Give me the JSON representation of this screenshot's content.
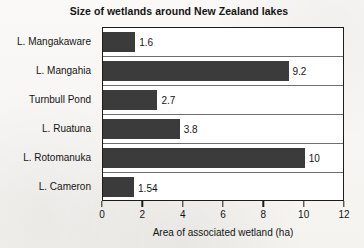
{
  "chart_data": {
    "type": "bar",
    "orientation": "horizontal",
    "title": "Size of wetlands around New Zealand lakes",
    "xlabel": "Area of associated wetland (ha)",
    "ylabel": "",
    "xlim": [
      0,
      12
    ],
    "xticks": [
      0,
      2,
      4,
      6,
      8,
      10,
      12
    ],
    "xtick_labels": [
      "0",
      "2",
      "4",
      "6",
      "8",
      "10",
      "12"
    ],
    "grid": "horizontal-category-separators",
    "legend": "none",
    "categories": [
      "L. Mangakaware",
      "L. Mangahia",
      "Turnbull Pond",
      "L. Ruatuna",
      "L. Rotomanuka",
      "L. Cameron"
    ],
    "values": [
      1.6,
      9.2,
      2.7,
      3.8,
      10,
      1.54
    ],
    "data_labels": [
      "1.6",
      "9.2",
      "2.7",
      "3.8",
      "10",
      "1.54"
    ],
    "bar_color": "#3b3b3b",
    "plot_background": "#ffffff",
    "frame_color": "#1c1c1c",
    "figure_background": "#f7f6f4"
  }
}
